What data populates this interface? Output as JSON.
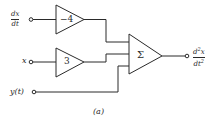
{
  "diagram": {
    "type": "analog-computer block diagram",
    "caption": "(a)",
    "inputs": [
      {
        "id": "dxdt",
        "label_num": "dx",
        "label_den": "dt"
      },
      {
        "id": "x",
        "label": "x"
      },
      {
        "id": "y",
        "label": "y(t)"
      }
    ],
    "amplifiers": [
      {
        "id": "amp-top",
        "gain": "−4"
      },
      {
        "id": "amp-mid",
        "gain": "3"
      }
    ],
    "summer": {
      "id": "summer",
      "symbol": "Σ"
    },
    "output": {
      "label_num": "d",
      "label_num_sup": "2",
      "label_num_var": "x",
      "label_den": "dt",
      "label_den_sup": "2"
    },
    "colors": {
      "stroke": "#2a2a2a",
      "background": "#ffffff"
    }
  }
}
